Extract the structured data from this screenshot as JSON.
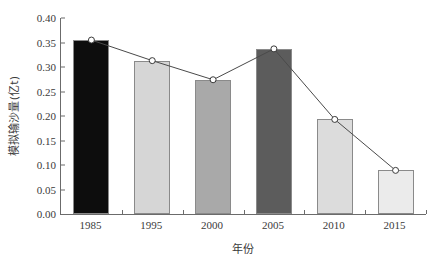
{
  "chart_data": {
    "type": "bar",
    "title": "",
    "subtitle": "",
    "xlabel": "年份",
    "ylabel": "模拟输沙量(亿t)",
    "categories": [
      "1985",
      "1995",
      "2000",
      "2005",
      "2010",
      "2015"
    ],
    "values": [
      0.355,
      0.313,
      0.274,
      0.337,
      0.193,
      0.089
    ],
    "series": [
      {
        "name": "模拟输沙量(亿t)",
        "type": "bar",
        "values": [
          0.355,
          0.313,
          0.274,
          0.337,
          0.193,
          0.089
        ]
      },
      {
        "name": "趋势线",
        "type": "line",
        "marker": "open-circle",
        "values": [
          0.355,
          0.313,
          0.274,
          0.337,
          0.193,
          0.089
        ]
      }
    ],
    "bar_colors": [
      "#0d0d0d",
      "#d6d6d6",
      "#a9a9a9",
      "#5c5c5c",
      "#dcdcdc",
      "#ebebeb"
    ],
    "bar_edge_color": "#8a8a8a",
    "line_color": "#4a4a4a",
    "marker_face_color": "#ffffff",
    "marker_edge_color": "#3a3a3a",
    "ylim": [
      0.0,
      0.4
    ],
    "ytick_values": [
      0.4,
      0.35,
      0.3,
      0.25,
      0.2,
      0.15,
      0.1,
      0.05,
      0.0
    ],
    "ytick_labels": [
      "0.40",
      "0.35",
      "0.30",
      "0.25",
      "0.20",
      "0.15",
      "0.10",
      "0.05",
      "0.00"
    ],
    "grid": false,
    "legend": false,
    "axis_color": "#6b6b6b",
    "background_color": "#ffffff"
  }
}
